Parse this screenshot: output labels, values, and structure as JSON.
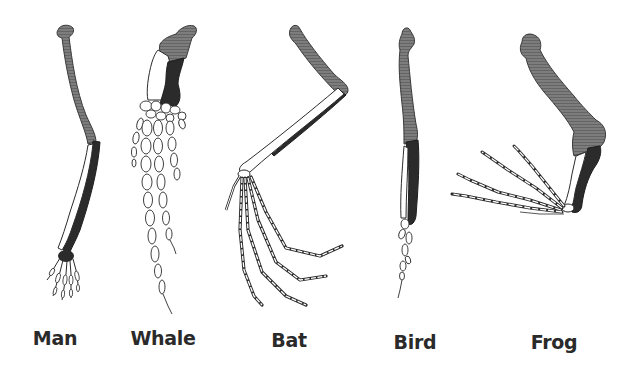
{
  "figure": {
    "colors": {
      "background": "#ffffff",
      "humerus_shading": "#7a7a7a",
      "ulna_shading": "#2b2b2b",
      "radius_fill": "#ffffff",
      "outline": "#2b2b2b",
      "label_text": "#2a2a2a"
    },
    "specimens": [
      {
        "id": "man",
        "label": "Man",
        "label_x": 52,
        "label_y": 327
      },
      {
        "id": "whale",
        "label": "Whale",
        "label_x": 162,
        "label_y": 327
      },
      {
        "id": "bat",
        "label": "Bat",
        "label_x": 289,
        "label_y": 329
      },
      {
        "id": "bird",
        "label": "Bird",
        "label_x": 415,
        "label_y": 331
      },
      {
        "id": "frog",
        "label": "Frog",
        "label_x": 554,
        "label_y": 331
      }
    ]
  }
}
